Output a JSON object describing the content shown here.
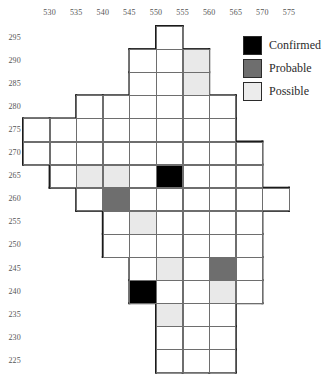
{
  "chart_data": {
    "type": "heatmap",
    "title": "",
    "xlabel": "",
    "ylabel": "",
    "grid": true,
    "legend_position": "top-right",
    "cell_size_x": 5,
    "cell_size_y": 5,
    "xlim": [
      528,
      580
    ],
    "ylim": [
      222,
      298
    ],
    "x_ticks": [
      "530",
      "535",
      "540",
      "545",
      "550",
      "555",
      "560",
      "565",
      "570",
      "575"
    ],
    "y_ticks": [
      "295",
      "290",
      "285",
      "280",
      "275",
      "270",
      "265",
      "260",
      "255",
      "250",
      "245",
      "240",
      "235",
      "230",
      "225"
    ],
    "categories": [
      "Confirmed",
      "Probable",
      "Possible"
    ],
    "category_colors": {
      "Confirmed": "#000000",
      "Probable": "#6e6e6e",
      "Possible": "#e9e9e9",
      "None": "#ffffff"
    },
    "cells": [
      {
        "col": 5,
        "row": 0,
        "x": 552.5,
        "y": 295.0,
        "status": "None"
      },
      {
        "col": 4,
        "row": 1,
        "x": 547.5,
        "y": 290.0,
        "status": "None"
      },
      {
        "col": 5,
        "row": 1,
        "x": 552.5,
        "y": 290.0,
        "status": "None"
      },
      {
        "col": 6,
        "row": 1,
        "x": 557.5,
        "y": 290.0,
        "status": "Possible"
      },
      {
        "col": 4,
        "row": 2,
        "x": 547.5,
        "y": 285.0,
        "status": "None"
      },
      {
        "col": 5,
        "row": 2,
        "x": 552.5,
        "y": 285.0,
        "status": "None"
      },
      {
        "col": 6,
        "row": 2,
        "x": 557.5,
        "y": 285.0,
        "status": "Possible"
      },
      {
        "col": 2,
        "row": 3,
        "x": 537.5,
        "y": 280.0,
        "status": "None"
      },
      {
        "col": 3,
        "row": 3,
        "x": 542.5,
        "y": 280.0,
        "status": "None"
      },
      {
        "col": 4,
        "row": 3,
        "x": 547.5,
        "y": 280.0,
        "status": "None"
      },
      {
        "col": 5,
        "row": 3,
        "x": 552.5,
        "y": 280.0,
        "status": "None"
      },
      {
        "col": 6,
        "row": 3,
        "x": 557.5,
        "y": 280.0,
        "status": "None"
      },
      {
        "col": 7,
        "row": 3,
        "x": 562.5,
        "y": 280.0,
        "status": "None"
      },
      {
        "col": 0,
        "row": 4,
        "x": 527.5,
        "y": 275.0,
        "status": "None"
      },
      {
        "col": 1,
        "row": 4,
        "x": 532.5,
        "y": 275.0,
        "status": "None"
      },
      {
        "col": 2,
        "row": 4,
        "x": 537.5,
        "y": 275.0,
        "status": "None"
      },
      {
        "col": 3,
        "row": 4,
        "x": 542.5,
        "y": 275.0,
        "status": "None"
      },
      {
        "col": 4,
        "row": 4,
        "x": 547.5,
        "y": 275.0,
        "status": "None"
      },
      {
        "col": 5,
        "row": 4,
        "x": 552.5,
        "y": 275.0,
        "status": "None"
      },
      {
        "col": 6,
        "row": 4,
        "x": 557.5,
        "y": 275.0,
        "status": "None"
      },
      {
        "col": 7,
        "row": 4,
        "x": 562.5,
        "y": 275.0,
        "status": "None"
      },
      {
        "col": 0,
        "row": 5,
        "x": 527.5,
        "y": 270.0,
        "status": "None"
      },
      {
        "col": 1,
        "row": 5,
        "x": 532.5,
        "y": 270.0,
        "status": "None"
      },
      {
        "col": 2,
        "row": 5,
        "x": 537.5,
        "y": 270.0,
        "status": "None"
      },
      {
        "col": 3,
        "row": 5,
        "x": 542.5,
        "y": 270.0,
        "status": "None"
      },
      {
        "col": 4,
        "row": 5,
        "x": 547.5,
        "y": 270.0,
        "status": "None"
      },
      {
        "col": 5,
        "row": 5,
        "x": 552.5,
        "y": 270.0,
        "status": "None"
      },
      {
        "col": 6,
        "row": 5,
        "x": 557.5,
        "y": 270.0,
        "status": "None"
      },
      {
        "col": 7,
        "row": 5,
        "x": 562.5,
        "y": 270.0,
        "status": "None"
      },
      {
        "col": 8,
        "row": 5,
        "x": 567.5,
        "y": 270.0,
        "status": "None"
      },
      {
        "col": 1,
        "row": 6,
        "x": 532.5,
        "y": 265.0,
        "status": "None"
      },
      {
        "col": 2,
        "row": 6,
        "x": 537.5,
        "y": 265.0,
        "status": "Possible"
      },
      {
        "col": 3,
        "row": 6,
        "x": 542.5,
        "y": 265.0,
        "status": "Possible"
      },
      {
        "col": 4,
        "row": 6,
        "x": 547.5,
        "y": 265.0,
        "status": "None"
      },
      {
        "col": 5,
        "row": 6,
        "x": 552.5,
        "y": 265.0,
        "status": "Confirmed"
      },
      {
        "col": 6,
        "row": 6,
        "x": 557.5,
        "y": 265.0,
        "status": "None"
      },
      {
        "col": 7,
        "row": 6,
        "x": 562.5,
        "y": 265.0,
        "status": "None"
      },
      {
        "col": 8,
        "row": 6,
        "x": 567.5,
        "y": 265.0,
        "status": "None"
      },
      {
        "col": 2,
        "row": 7,
        "x": 537.5,
        "y": 260.0,
        "status": "None"
      },
      {
        "col": 3,
        "row": 7,
        "x": 542.5,
        "y": 260.0,
        "status": "Probable"
      },
      {
        "col": 4,
        "row": 7,
        "x": 547.5,
        "y": 260.0,
        "status": "None"
      },
      {
        "col": 5,
        "row": 7,
        "x": 552.5,
        "y": 260.0,
        "status": "None"
      },
      {
        "col": 6,
        "row": 7,
        "x": 557.5,
        "y": 260.0,
        "status": "None"
      },
      {
        "col": 7,
        "row": 7,
        "x": 562.5,
        "y": 260.0,
        "status": "None"
      },
      {
        "col": 8,
        "row": 7,
        "x": 567.5,
        "y": 260.0,
        "status": "None"
      },
      {
        "col": 9,
        "row": 7,
        "x": 572.5,
        "y": 260.0,
        "status": "None"
      },
      {
        "col": 3,
        "row": 8,
        "x": 542.5,
        "y": 255.0,
        "status": "None"
      },
      {
        "col": 4,
        "row": 8,
        "x": 547.5,
        "y": 255.0,
        "status": "Possible"
      },
      {
        "col": 5,
        "row": 8,
        "x": 552.5,
        "y": 255.0,
        "status": "None"
      },
      {
        "col": 6,
        "row": 8,
        "x": 557.5,
        "y": 255.0,
        "status": "None"
      },
      {
        "col": 7,
        "row": 8,
        "x": 562.5,
        "y": 255.0,
        "status": "None"
      },
      {
        "col": 8,
        "row": 8,
        "x": 567.5,
        "y": 255.0,
        "status": "None"
      },
      {
        "col": 3,
        "row": 9,
        "x": 542.5,
        "y": 250.0,
        "status": "None"
      },
      {
        "col": 4,
        "row": 9,
        "x": 547.5,
        "y": 250.0,
        "status": "None"
      },
      {
        "col": 5,
        "row": 9,
        "x": 552.5,
        "y": 250.0,
        "status": "None"
      },
      {
        "col": 6,
        "row": 9,
        "x": 557.5,
        "y": 250.0,
        "status": "None"
      },
      {
        "col": 7,
        "row": 9,
        "x": 562.5,
        "y": 250.0,
        "status": "None"
      },
      {
        "col": 8,
        "row": 9,
        "x": 567.5,
        "y": 250.0,
        "status": "None"
      },
      {
        "col": 4,
        "row": 10,
        "x": 547.5,
        "y": 245.0,
        "status": "None"
      },
      {
        "col": 5,
        "row": 10,
        "x": 552.5,
        "y": 245.0,
        "status": "Possible"
      },
      {
        "col": 6,
        "row": 10,
        "x": 557.5,
        "y": 245.0,
        "status": "None"
      },
      {
        "col": 7,
        "row": 10,
        "x": 562.5,
        "y": 245.0,
        "status": "Probable"
      },
      {
        "col": 8,
        "row": 10,
        "x": 567.5,
        "y": 245.0,
        "status": "None"
      },
      {
        "col": 4,
        "row": 11,
        "x": 547.5,
        "y": 240.0,
        "status": "Confirmed"
      },
      {
        "col": 5,
        "row": 11,
        "x": 552.5,
        "y": 240.0,
        "status": "None"
      },
      {
        "col": 6,
        "row": 11,
        "x": 557.5,
        "y": 240.0,
        "status": "None"
      },
      {
        "col": 7,
        "row": 11,
        "x": 562.5,
        "y": 240.0,
        "status": "Possible"
      },
      {
        "col": 8,
        "row": 11,
        "x": 567.5,
        "y": 240.0,
        "status": "None"
      },
      {
        "col": 5,
        "row": 12,
        "x": 552.5,
        "y": 235.0,
        "status": "Possible"
      },
      {
        "col": 6,
        "row": 12,
        "x": 557.5,
        "y": 235.0,
        "status": "None"
      },
      {
        "col": 7,
        "row": 12,
        "x": 562.5,
        "y": 235.0,
        "status": "None"
      },
      {
        "col": 5,
        "row": 13,
        "x": 552.5,
        "y": 230.0,
        "status": "None"
      },
      {
        "col": 6,
        "row": 13,
        "x": 557.5,
        "y": 230.0,
        "status": "None"
      },
      {
        "col": 7,
        "row": 13,
        "x": 562.5,
        "y": 230.0,
        "status": "None"
      },
      {
        "col": 5,
        "row": 14,
        "x": 552.5,
        "y": 225.0,
        "status": "None"
      },
      {
        "col": 6,
        "row": 14,
        "x": 557.5,
        "y": 225.0,
        "status": "None"
      },
      {
        "col": 7,
        "row": 14,
        "x": 562.5,
        "y": 225.0,
        "status": "None"
      }
    ]
  },
  "legend": {
    "items": [
      {
        "label": "Confirmed",
        "color": "#000000",
        "swatch": "confirmed"
      },
      {
        "label": "Probable",
        "color": "#6e6e6e",
        "swatch": "probable"
      },
      {
        "label": "Possible",
        "color": "#ececec",
        "swatch": "possible"
      }
    ]
  }
}
